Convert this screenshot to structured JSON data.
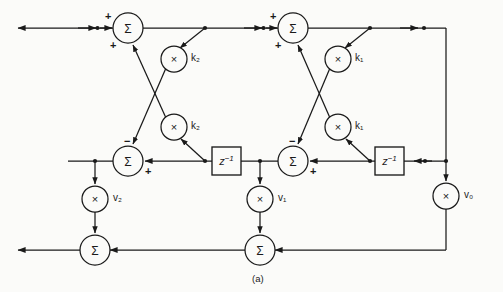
{
  "figure": {
    "caption": "(a)",
    "type": "lattice-filter-signal-flow-graph",
    "background_color": "#fbfbf9",
    "line_color": "#1a1a1a"
  },
  "nodes": {
    "sum_top_left": {
      "symbol": "Σ",
      "name": "summer",
      "x": 128,
      "y": 28,
      "r": 15
    },
    "sum_top_right": {
      "symbol": "Σ",
      "name": "summer",
      "x": 293,
      "y": 28,
      "r": 15
    },
    "sum_mid_left": {
      "symbol": "Σ",
      "name": "summer",
      "x": 128,
      "y": 160,
      "r": 15
    },
    "sum_mid_right": {
      "symbol": "Σ",
      "name": "summer",
      "x": 293,
      "y": 160,
      "r": 15
    },
    "sum_bottom_left": {
      "symbol": "Σ",
      "name": "summer",
      "x": 95,
      "y": 250,
      "r": 15
    },
    "sum_bottom_center": {
      "symbol": "Σ",
      "name": "summer",
      "x": 260,
      "y": 250,
      "r": 15
    },
    "mult_k2_upper": {
      "symbol": "×",
      "name": "multiplier",
      "x": 174,
      "y": 59,
      "r": 13
    },
    "mult_k2_lower": {
      "symbol": "×",
      "name": "multiplier",
      "x": 174,
      "y": 127,
      "r": 13
    },
    "mult_k1_upper": {
      "symbol": "×",
      "name": "multiplier",
      "x": 338,
      "y": 59,
      "r": 13
    },
    "mult_k1_lower": {
      "symbol": "×",
      "name": "multiplier",
      "x": 338,
      "y": 127,
      "r": 13
    },
    "mult_v2": {
      "symbol": "×",
      "name": "multiplier",
      "x": 95,
      "y": 199,
      "r": 13
    },
    "mult_v1": {
      "symbol": "×",
      "name": "multiplier",
      "x": 260,
      "y": 199,
      "r": 13
    },
    "mult_v0": {
      "symbol": "×",
      "name": "multiplier",
      "x": 446,
      "y": 196,
      "r": 13
    }
  },
  "delays": {
    "delay_left": {
      "label": "z⁻¹",
      "x": 212,
      "y": 147,
      "w": 29,
      "h": 28
    },
    "delay_right": {
      "label": "z⁻¹",
      "x": 375,
      "y": 147,
      "w": 29,
      "h": 28
    }
  },
  "gain_labels": {
    "k2_upper": "k₂",
    "k2_lower": "k₂",
    "k1_upper": "k₁",
    "k1_lower": "k₁",
    "v2": "v₂",
    "v1": "v₁",
    "v0": "v₀"
  },
  "sign_labels": {
    "top_left_plus_in": "+",
    "top_left_plus_fb": "+",
    "top_right_plus_in": "+",
    "top_right_plus_fb": "+",
    "mid_left_minus": "−",
    "mid_left_plus": "+",
    "mid_right_minus": "−",
    "mid_right_plus": "+"
  },
  "gain_label_positions": {
    "k2_upper": {
      "x": 191,
      "y": 53
    },
    "k2_lower": {
      "x": 191,
      "y": 121
    },
    "k1_upper": {
      "x": 355,
      "y": 53
    },
    "k1_lower": {
      "x": 355,
      "y": 121
    },
    "v2": {
      "x": 113,
      "y": 193
    },
    "v1": {
      "x": 278,
      "y": 193
    },
    "v0": {
      "x": 464,
      "y": 190
    }
  },
  "sign_label_positions": {
    "top_left_plus_in": {
      "x": 105,
      "y": 11
    },
    "top_left_plus_fb": {
      "x": 110,
      "y": 40
    },
    "top_right_plus_in": {
      "x": 270,
      "y": 11
    },
    "top_right_plus_fb": {
      "x": 275,
      "y": 40
    },
    "mid_left_minus": {
      "x": 124,
      "y": 136
    },
    "mid_left_plus": {
      "x": 145,
      "y": 166
    },
    "mid_right_minus": {
      "x": 289,
      "y": 136
    },
    "mid_right_plus": {
      "x": 310,
      "y": 166
    }
  },
  "caption_position": {
    "x": 252,
    "y": 274
  }
}
